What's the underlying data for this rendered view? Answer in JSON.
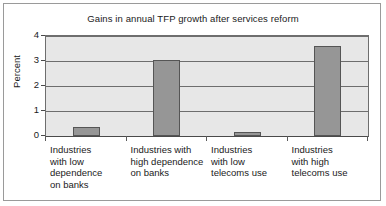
{
  "chart_data": {
    "type": "bar",
    "title": "Gains in annual TFP growth after services reform",
    "xlabel": "",
    "ylabel": "Percent",
    "ylim": [
      0,
      4
    ],
    "yticks": [
      0,
      1,
      2,
      3,
      4
    ],
    "ytick_labels": [
      "0",
      "1",
      "2",
      "3",
      "4"
    ],
    "grid": true,
    "legend": false,
    "categories": [
      "Industries with low dependence on banks",
      "Industries with high dependence on banks",
      "Industries with low telecoms use",
      "Industries with high telecoms use"
    ],
    "category_lines": [
      [
        "Industries",
        "with low",
        "dependence",
        "on banks"
      ],
      [
        "Industries with",
        "high dependence",
        "on banks"
      ],
      [
        "Industries",
        "with low",
        "telecoms use"
      ],
      [
        "Industries",
        "with high",
        "telecoms use"
      ]
    ],
    "values": [
      0.35,
      3.05,
      0.15,
      3.6
    ],
    "bar_color": "#969696",
    "bar_edge_color": "#555555",
    "plot_background": "#e7e7e7",
    "gridline_color": "#6e6e6e",
    "axis_color": "#4a4a4a",
    "figure_border_color": "#9a9a9a"
  }
}
